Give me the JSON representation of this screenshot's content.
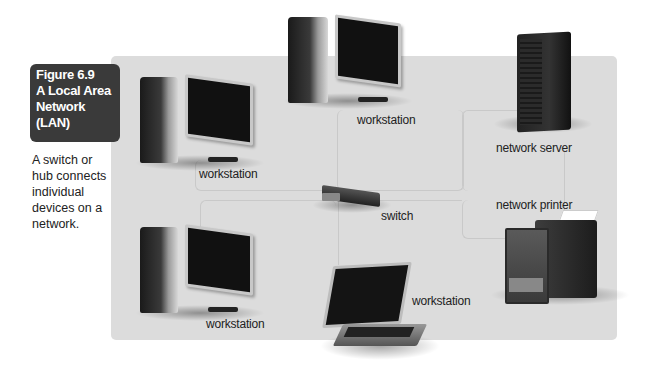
{
  "figure": {
    "number_label": "Figure 6.9",
    "title_lines": [
      "A Local Area",
      "Network",
      "(LAN)"
    ],
    "description": "A switch or hub connects individual devices on a network."
  },
  "diagram": {
    "panel_color": "#dcdcdc",
    "caption_box_color": "#3a3a3a",
    "nodes": [
      {
        "id": "workstation-top-left",
        "type": "desktop",
        "label": "workstation"
      },
      {
        "id": "workstation-top-center",
        "type": "desktop",
        "label": "workstation"
      },
      {
        "id": "network-server",
        "type": "server",
        "label": "network server"
      },
      {
        "id": "switch",
        "type": "switch",
        "label": "switch"
      },
      {
        "id": "network-printer",
        "type": "printer",
        "label": "network printer"
      },
      {
        "id": "workstation-bottom-left",
        "type": "desktop",
        "label": "workstation"
      },
      {
        "id": "workstation-laptop",
        "type": "laptop",
        "label": "workstation"
      }
    ],
    "connections": [
      [
        "switch",
        "workstation-top-left"
      ],
      [
        "switch",
        "workstation-top-center"
      ],
      [
        "switch",
        "network-server"
      ],
      [
        "switch",
        "network-printer"
      ],
      [
        "switch",
        "workstation-bottom-left"
      ],
      [
        "switch",
        "workstation-laptop"
      ]
    ]
  }
}
